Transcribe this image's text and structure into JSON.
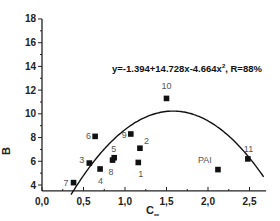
{
  "chart_data": {
    "type": "scatter",
    "title": "",
    "xlabel": "C∞",
    "ylabel": "B",
    "xlim": [
      0.0,
      2.7
    ],
    "ylim": [
      3.5,
      18
    ],
    "xticks": [
      "0.0",
      "0.5",
      "1.0",
      "1.5",
      "2.0",
      "2.5"
    ],
    "yticks": [
      "4",
      "6",
      "8",
      "10",
      "12",
      "14",
      "16",
      "18"
    ],
    "grid": false,
    "annotation": "y=-1.394+14.728x-4.664x², R=88%",
    "fit": {
      "type": "quadratic",
      "a0": -1.394,
      "a1": 14.728,
      "a2": -4.664,
      "R": "88%"
    },
    "points": [
      {
        "label": "1",
        "x": 1.16,
        "y": 5.9
      },
      {
        "label": "2",
        "x": 1.18,
        "y": 7.1
      },
      {
        "label": "3",
        "x": 0.57,
        "y": 5.85
      },
      {
        "label": "4",
        "x": 0.7,
        "y": 5.35
      },
      {
        "label": "5",
        "x": 0.87,
        "y": 6.3
      },
      {
        "label": "6",
        "x": 0.64,
        "y": 8.1
      },
      {
        "label": "7",
        "x": 0.38,
        "y": 4.2
      },
      {
        "label": "8",
        "x": 0.85,
        "y": 6.1
      },
      {
        "label": "9",
        "x": 1.07,
        "y": 8.3
      },
      {
        "label": "10",
        "x": 1.5,
        "y": 11.3
      },
      {
        "label": "11",
        "x": 2.48,
        "y": 6.2
      },
      {
        "label": "PAI",
        "x": 2.12,
        "y": 5.3
      }
    ]
  },
  "labels": {
    "equation": "y=-1.394+14.728x-4.664x",
    "equation_sup": "2",
    "equation_tail": ", R=88%",
    "xlabel_main": "C",
    "xlabel_sub": "∞",
    "ylabel": "B"
  }
}
